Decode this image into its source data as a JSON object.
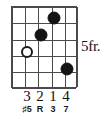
{
  "diagram": {
    "type": "guitar-chord-diagram",
    "strings": 6,
    "frets": 5,
    "fret_position_label": "5fr.",
    "grid": {
      "string_x": [
        0,
        13.2,
        26.4,
        39.6,
        52.8,
        66
      ],
      "fret_y": [
        0,
        16.4,
        32.8,
        49.2,
        65.6,
        82
      ]
    },
    "markers": [
      {
        "name": "marker-string4-fret1",
        "string": 4,
        "fret": 1,
        "style": "filled",
        "x": 42,
        "y": 11
      },
      {
        "name": "marker-string3-fret2",
        "string": 3,
        "fret": 2,
        "style": "filled",
        "x": 29,
        "y": 28
      },
      {
        "name": "marker-string2-fret3",
        "string": 2,
        "fret": 3,
        "style": "open",
        "x": 15,
        "y": 45
      },
      {
        "name": "marker-string5-fret4",
        "string": 5,
        "fret": 4,
        "style": "filled",
        "x": 55,
        "y": 62
      }
    ],
    "fingerings": [
      {
        "name": "finger-number-string2",
        "label": "3",
        "x": 27
      },
      {
        "name": "finger-number-string3",
        "label": "2",
        "x": 40
      },
      {
        "name": "finger-number-string4",
        "label": "1",
        "x": 53
      },
      {
        "name": "finger-number-string5",
        "label": "4",
        "x": 66
      }
    ],
    "intervals": [
      {
        "name": "interval-label-string2",
        "label": "♯5",
        "x": 27
      },
      {
        "name": "interval-label-string3",
        "label": "R",
        "x": 40
      },
      {
        "name": "interval-label-string4",
        "label": "3",
        "x": 53
      },
      {
        "name": "interval-label-string5",
        "label": "7",
        "x": 66
      }
    ],
    "colors": {
      "grid": "#4a4a4a",
      "dot_filled": "#141414",
      "dot_open_border": "#1a1a1a",
      "text": "#111111",
      "background": "#ffffff"
    }
  }
}
